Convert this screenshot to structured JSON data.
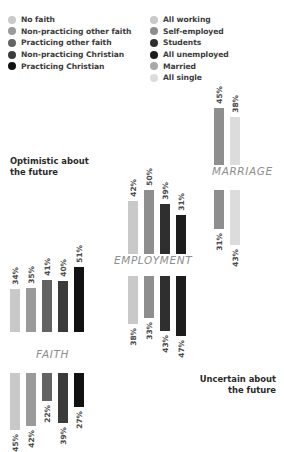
{
  "legend_faith": {
    "items": [
      {
        "label": "No faith",
        "color": "#c9c9c9"
      },
      {
        "label": "Non-practicing other faith",
        "color": "#9a9a9a"
      },
      {
        "label": "Practicing other faith",
        "color": "#636363"
      },
      {
        "label": "Non-practicing Christian",
        "color": "#3b3b3b"
      },
      {
        "label": "Practicing Christian",
        "color": "#121212"
      }
    ]
  },
  "legend_status": {
    "items": [
      {
        "label": "All working",
        "color": "#c9c9c9"
      },
      {
        "label": "Self-employed",
        "color": "#8e8e8e"
      },
      {
        "label": "Students",
        "color": "#2f2f2f"
      },
      {
        "label": "All unemployed",
        "color": "#1c1c1c"
      },
      {
        "label": "Married",
        "color": "#a8a8a8"
      },
      {
        "label": "All single",
        "color": "#dcdcdc"
      }
    ]
  },
  "captions": {
    "optimistic": "Optimistic about\nthe future",
    "uncertain": "Uncertain about\nthe future"
  },
  "chart_data": [
    {
      "type": "bar",
      "title": "FAITH",
      "categories": [
        "No faith",
        "Non-practicing other faith",
        "Practicing other faith",
        "Non-practicing Christian",
        "Practicing Christian"
      ],
      "colors": [
        "#c9c9c9",
        "#9a9a9a",
        "#636363",
        "#3b3b3b",
        "#121212"
      ],
      "series": [
        {
          "name": "Optimistic about the future",
          "direction": "up",
          "values": [
            34,
            35,
            41,
            40,
            51
          ],
          "labels": [
            "34%",
            "35%",
            "41%",
            "40%",
            "51%"
          ]
        },
        {
          "name": "Uncertain about the future",
          "direction": "down",
          "values": [
            45,
            42,
            22,
            39,
            27
          ],
          "labels": [
            "45%",
            "42%",
            "22%",
            "39%",
            "27%"
          ]
        }
      ],
      "ylabel": "",
      "xlabel": "",
      "grid": false
    },
    {
      "type": "bar",
      "title": "EMPLOYMENT",
      "categories": [
        "All working",
        "Self-employed",
        "Students",
        "All unemployed"
      ],
      "colors": [
        "#c9c9c9",
        "#8e8e8e",
        "#2f2f2f",
        "#1c1c1c"
      ],
      "series": [
        {
          "name": "Optimistic about the future",
          "direction": "up",
          "values": [
            42,
            50,
            39,
            31
          ],
          "labels": [
            "42%",
            "50%",
            "39%",
            "31%"
          ]
        },
        {
          "name": "Uncertain about the future",
          "direction": "down",
          "values": [
            38,
            33,
            43,
            47
          ],
          "labels": [
            "38%",
            "33%",
            "43%",
            "47%"
          ]
        }
      ],
      "ylabel": "",
      "xlabel": "",
      "grid": false
    },
    {
      "type": "bar",
      "title": "MARRIAGE",
      "categories": [
        "Married",
        "All single"
      ],
      "colors": [
        "#8e8e8e",
        "#dcdcdc"
      ],
      "series": [
        {
          "name": "Optimistic about the future",
          "direction": "up",
          "values": [
            45,
            38
          ],
          "labels": [
            "45%",
            "38%"
          ]
        },
        {
          "name": "Uncertain about the future",
          "direction": "down",
          "values": [
            31,
            43
          ],
          "labels": [
            "31%",
            "43%"
          ]
        }
      ],
      "ylabel": "",
      "xlabel": "",
      "grid": false
    }
  ]
}
